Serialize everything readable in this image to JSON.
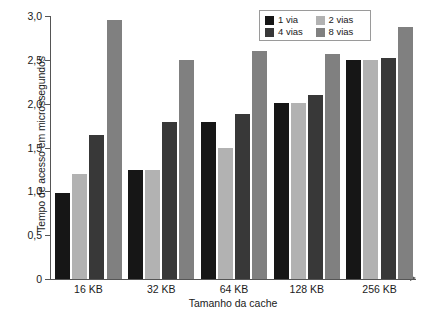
{
  "chart_data": {
    "type": "bar",
    "title": "",
    "subtitle": "",
    "xlabel": "Tamanho da cache",
    "ylabel": "Tempo de acesso em microssegundos",
    "categories": [
      "16 KB",
      "32 KB",
      "64 KB",
      "128 KB",
      "256 KB"
    ],
    "series": [
      {
        "name": "1 via",
        "color": "#161616",
        "values": [
          0.98,
          1.24,
          1.79,
          2.01,
          2.5
        ]
      },
      {
        "name": "2 vias",
        "color": "#b2b2b2",
        "values": [
          1.2,
          1.24,
          1.49,
          2.01,
          2.5
        ]
      },
      {
        "name": "4 vias",
        "color": "#383838",
        "values": [
          1.64,
          1.79,
          1.88,
          2.1,
          2.52
        ]
      },
      {
        "name": "8 vias",
        "color": "#808080",
        "values": [
          2.96,
          2.5,
          2.6,
          2.57,
          2.87
        ]
      }
    ],
    "ylim": [
      0,
      3.0
    ],
    "ytick_values": [
      0,
      0.5,
      1.0,
      1.5,
      2.0,
      2.5,
      3.0
    ],
    "ytick_labels": [
      "0",
      "0,5",
      "1,0",
      "1,5",
      "2,0",
      "2,5",
      "3,0"
    ],
    "grid": false,
    "legend_position": "top-right",
    "legend_entries": [
      "1 via",
      "2 vias",
      "4 vias",
      "8 vias"
    ]
  }
}
